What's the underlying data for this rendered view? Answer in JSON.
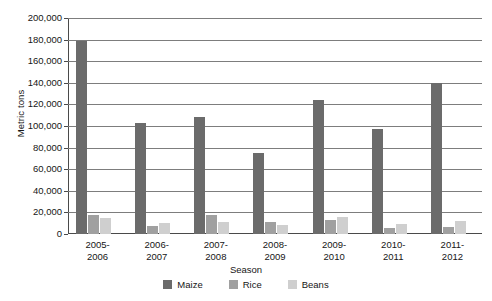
{
  "chart_data": {
    "type": "bar",
    "title": "",
    "xlabel": "Season",
    "ylabel": "Metric tons",
    "ylim": [
      0,
      200000
    ],
    "ytick_step": 20000,
    "grid": true,
    "legend_position": "bottom",
    "categories": [
      "2005-\n2006",
      "2006-\n2007",
      "2007-\n2008",
      "2008-\n2009",
      "2009-\n2010",
      "2010-\n2011",
      "2011-\n2012"
    ],
    "category_lines": [
      [
        "2005-",
        "2006"
      ],
      [
        "2006-",
        "2007"
      ],
      [
        "2007-",
        "2008"
      ],
      [
        "2008-",
        "2009"
      ],
      [
        "2009-",
        "2010"
      ],
      [
        "2010-",
        "2011"
      ],
      [
        "2011-",
        "2012"
      ]
    ],
    "ytick_labels": [
      "200,000",
      "180,000",
      "160,000",
      "140,000",
      "120,000",
      "100,000",
      "80,000",
      "60,000",
      "40,000",
      "20,000",
      "0"
    ],
    "ytick_values": [
      200000,
      180000,
      160000,
      140000,
      120000,
      100000,
      80000,
      60000,
      40000,
      20000,
      0
    ],
    "series": [
      {
        "name": "Maize",
        "color": "#6b6b6b",
        "values": [
          179000,
          103000,
          108500,
          75000,
          124000,
          97000,
          140000
        ]
      },
      {
        "name": "Rice",
        "color": "#a0a0a0",
        "values": [
          17500,
          7500,
          18000,
          11000,
          13000,
          5500,
          6500
        ]
      },
      {
        "name": "Beans",
        "color": "#cfcfcf",
        "values": [
          14500,
          10000,
          11500,
          8000,
          15500,
          9000,
          12500
        ]
      }
    ]
  },
  "legend": {
    "items": [
      {
        "label": "Maize",
        "color": "#6b6b6b"
      },
      {
        "label": "Rice",
        "color": "#a0a0a0"
      },
      {
        "label": "Beans",
        "color": "#cfcfcf"
      }
    ]
  },
  "axes": {
    "y_title": "Metric tons",
    "x_title": "Season"
  }
}
